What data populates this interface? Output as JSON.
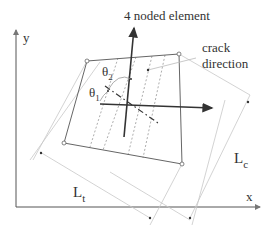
{
  "title": "4 noded element",
  "labels": {
    "crack_line1": "crack",
    "crack_line2": "direction",
    "y_axis": "y",
    "x_axis": "x",
    "theta1": "θ",
    "theta1_sub": "1",
    "theta2": "θ",
    "theta2_sub": "2",
    "Lt": "L",
    "Lt_sub": "t",
    "Lc": "L",
    "Lc_sub": "c"
  },
  "colors": {
    "axis": "#555555",
    "element": "#666666",
    "dim": "#c8c8c8",
    "crack": "#999999",
    "arrow": "#333333"
  }
}
